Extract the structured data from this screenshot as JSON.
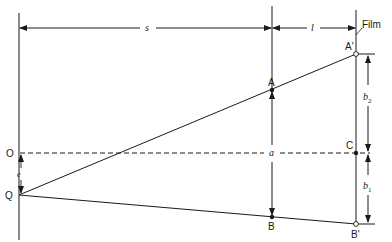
{
  "diagram": {
    "dimensions": {
      "object_distance": "s",
      "image_distance": "l",
      "offset": "e",
      "height": "a",
      "upper_image": "b",
      "upper_image_sub": "2",
      "lower_image": "b",
      "lower_image_sub": "1"
    },
    "points": {
      "O": "O",
      "Q": "Q",
      "A": "A",
      "B": "B",
      "A_prime": "A'",
      "B_prime": "B'",
      "C": "C"
    },
    "film_label": "Film",
    "colors": {
      "ink": "#1a1a1a",
      "background": "#ffffff"
    }
  }
}
